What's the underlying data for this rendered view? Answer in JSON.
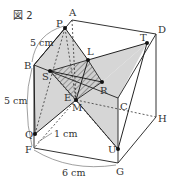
{
  "figure": {
    "title": "図 2"
  },
  "vertices": {
    "A": "A",
    "B": "B",
    "C": "C",
    "D": "D",
    "E": "E",
    "F": "F",
    "G": "G",
    "H": "H"
  },
  "points": {
    "P": "P",
    "Q": "Q",
    "R": "R",
    "S": "S",
    "T": "T",
    "U": "U",
    "L": "L",
    "M": "M"
  },
  "measurements": {
    "ab": "5 cm",
    "bf": "5 cm",
    "fq": "1 cm",
    "fg": "6 cm"
  },
  "colors": {
    "shade": "#d6d6d6",
    "line": "#333333",
    "hatch": "#555555"
  }
}
